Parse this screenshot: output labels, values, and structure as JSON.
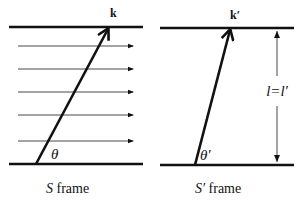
{
  "left_panel": {
    "vector_label": "k",
    "angle_label": "θ",
    "caption_symbol": "S",
    "caption_text": " frame",
    "field_lines_count": 5
  },
  "right_panel": {
    "vector_label": "k′",
    "angle_label": "θ′",
    "caption_symbol": "S′",
    "caption_text": " frame",
    "length_label": "l=l′"
  },
  "colors": {
    "ink": "#111111",
    "background": "#ffffff"
  }
}
